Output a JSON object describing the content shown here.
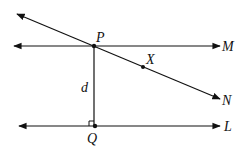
{
  "diagram": {
    "labels": {
      "P": "P",
      "M": "M",
      "X": "X",
      "N": "N",
      "d": "d",
      "Q": "Q",
      "L": "L"
    },
    "colors": {
      "stroke": "#111111",
      "background": "#ffffff"
    }
  }
}
